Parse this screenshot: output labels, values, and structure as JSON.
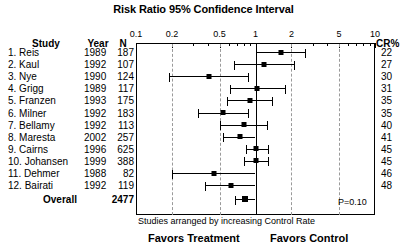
{
  "chart_data": {
    "type": "forest",
    "title": "Risk Ratio 95% Confidence Interval",
    "xlabel": "",
    "ylabel": "",
    "xscale": "log",
    "xlim": [
      0.1,
      10
    ],
    "tick_values": [
      0.1,
      0.2,
      0.5,
      1,
      2,
      5,
      10
    ],
    "tick_labels": [
      "0.1",
      "0.2",
      "0.5",
      "1",
      "2",
      "5",
      "10"
    ],
    "gridlines": [
      0.2,
      0.5,
      2,
      5
    ],
    "null_value": 1,
    "grid": true,
    "legend": "none",
    "columns": [
      "Study",
      "Year",
      "N",
      "CR%"
    ],
    "footnote": "Studies arranged by increasing Control Rate",
    "left_annotation": "Favors Treatment",
    "right_annotation": "Favors Control",
    "pvalue_label": "P=0.10",
    "studies": [
      {
        "label": "1. Reis",
        "year": "1989",
        "n": "187",
        "cr": "22",
        "rr": 1.65,
        "lo": 1.0,
        "hi": 2.62
      },
      {
        "label": "2. Kaul",
        "year": "1992",
        "n": "107",
        "cr": "27",
        "rr": 1.18,
        "lo": 0.66,
        "hi": 2.1
      },
      {
        "label": "3. Nye",
        "year": "1990",
        "n": "124",
        "cr": "30",
        "rr": 0.41,
        "lo": 0.19,
        "hi": 0.87
      },
      {
        "label": "4. Grigg",
        "year": "1989",
        "n": "117",
        "cr": "31",
        "rr": 1.02,
        "lo": 0.61,
        "hi": 1.78
      },
      {
        "label": "5. Franzen",
        "year": "1993",
        "n": "175",
        "cr": "35",
        "rr": 0.9,
        "lo": 0.58,
        "hi": 1.38
      },
      {
        "label": "6. Milner",
        "year": "1992",
        "n": "183",
        "cr": "35",
        "rr": 0.53,
        "lo": 0.33,
        "hi": 0.86
      },
      {
        "label": "7. Bellamy",
        "year": "1992",
        "n": "113",
        "cr": "40",
        "rr": 0.8,
        "lo": 0.5,
        "hi": 1.26
      },
      {
        "label": "8. Maresta",
        "year": "2002",
        "n": "257",
        "cr": "41",
        "rr": 0.74,
        "lo": 0.53,
        "hi": 1.0
      },
      {
        "label": "9. Cairns",
        "year": "1996",
        "n": "625",
        "cr": "45",
        "rr": 1.0,
        "lo": 0.83,
        "hi": 1.27
      },
      {
        "label": "10. Johansen",
        "year": "1999",
        "n": "388",
        "cr": "45",
        "rr": 1.0,
        "lo": 0.8,
        "hi": 1.28
      },
      {
        "label": "11. Dehmer",
        "year": "1988",
        "n": "82",
        "cr": "46",
        "rr": 0.45,
        "lo": 0.2,
        "hi": 1.0
      },
      {
        "label": "12. Bairati",
        "year": "1992",
        "n": "119",
        "cr": "48",
        "rr": 0.62,
        "lo": 0.38,
        "hi": 1.0
      }
    ],
    "overall": {
      "label": "Overall",
      "year": "",
      "n": "2477",
      "rr": 0.82,
      "lo": 0.68,
      "hi": 1.0
    }
  }
}
